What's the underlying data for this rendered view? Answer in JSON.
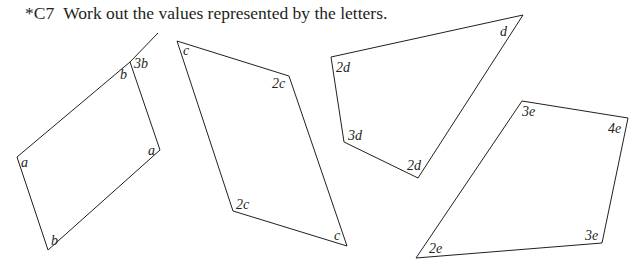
{
  "question": {
    "number": "*C7",
    "text": "Work out the values represented by the letters."
  },
  "figures": [
    {
      "id": "parallelogram-ab",
      "type": "parallelogram with extended side",
      "angle_labels": {
        "top_interior": "b",
        "top_exterior": "3b",
        "left": "a",
        "right": "a",
        "bottom": "b"
      }
    },
    {
      "id": "parallelogram-c",
      "type": "parallelogram",
      "angle_labels": {
        "top_left": "c",
        "right": "2c",
        "bottom_left": "2c",
        "bottom_right": "c"
      }
    },
    {
      "id": "quadrilateral-d",
      "type": "quadrilateral",
      "angle_labels": {
        "top_right": "d",
        "top_left": "2d",
        "bottom_left": "3d",
        "bottom": "2d"
      }
    },
    {
      "id": "quadrilateral-e",
      "type": "quadrilateral",
      "angle_labels": {
        "top": "3e",
        "right": "4e",
        "bottom_right": "3e",
        "bottom_left": "2e"
      }
    }
  ]
}
